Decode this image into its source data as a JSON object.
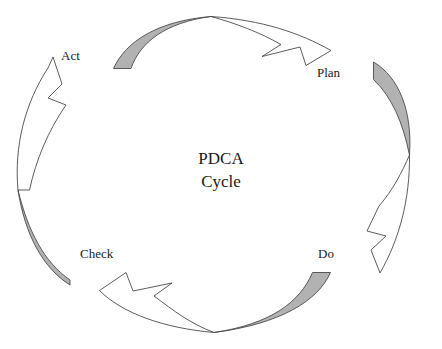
{
  "diagram": {
    "title_line1": "PDCA",
    "title_line2": "Cycle",
    "stages": [
      {
        "label": "Act",
        "name": "act"
      },
      {
        "label": "Plan",
        "name": "plan"
      },
      {
        "label": "Do",
        "name": "do"
      },
      {
        "label": "Check",
        "name": "check"
      }
    ],
    "colors": {
      "tail_fill": "#b2b2b2",
      "head_fill": "#ffffff",
      "outline": "#4a4a4a",
      "text": "#1a1a1a",
      "background": "#ffffff"
    },
    "flow_direction": "clockwise",
    "transitions": [
      "Act to Plan",
      "Plan to Do",
      "Do to Check",
      "Check to Act"
    ]
  }
}
